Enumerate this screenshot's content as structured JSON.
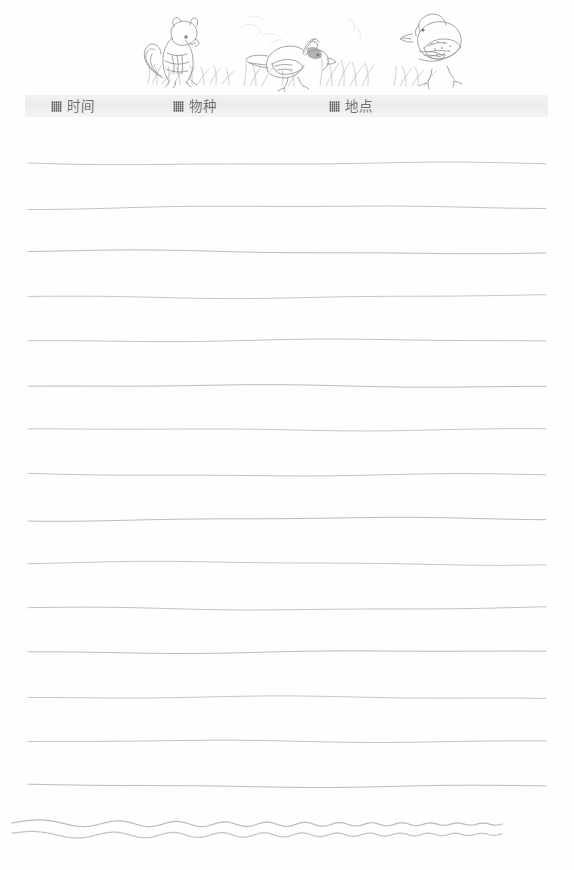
{
  "page": {
    "kind": "nature-journal-worksheet",
    "background_color": "#fefefe",
    "width": 574,
    "height": 870
  },
  "illustration": {
    "name": "wildlife-sketch-header",
    "description": "Pencil sketch of a chipmunk and two birds standing in grass",
    "ink_color": "#8d8d8d",
    "subjects": [
      {
        "name": "chipmunk",
        "x": 180,
        "y": 48
      },
      {
        "name": "crested-bird",
        "x": 300,
        "y": 55
      },
      {
        "name": "sparrow-bird",
        "x": 375,
        "y": 48
      }
    ]
  },
  "field_band": {
    "background_color": "#eeeeee",
    "fields": [
      {
        "id": "time",
        "icon": "hatched-square-icon",
        "label": "时间"
      },
      {
        "id": "species",
        "icon": "hatched-square-icon",
        "label": "物种"
      },
      {
        "id": "place",
        "icon": "hatched-square-icon",
        "label": "地点"
      }
    ]
  },
  "ruled_lines": {
    "name": "writing-lines",
    "count": 15,
    "first_y": 163,
    "spacing": 44.5,
    "left_x": 28,
    "right_x": 546,
    "color": "#a8a8a8",
    "style": "hand-drawn-wavy"
  },
  "wave_border": {
    "name": "bottom-wave-decoration",
    "lines": 2,
    "left_x": 12,
    "right_x": 502,
    "color": "#b4b4b4",
    "top_y": 823,
    "second_y": 834
  }
}
